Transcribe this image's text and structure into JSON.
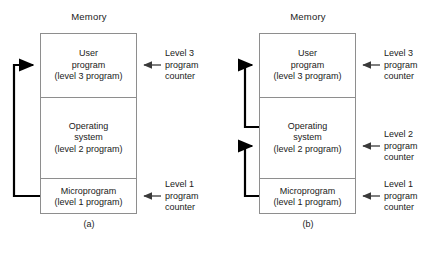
{
  "figure": {
    "background_color": "#ffffff",
    "box_border_color": "#8e8e8e",
    "arrow_color": "#000000",
    "pointer_arrow_color": "#3a3a3a",
    "text_color": "#1a1a1a"
  },
  "panels": [
    {
      "id": "a",
      "caption": "(a)",
      "memory_title": "Memory",
      "segments": [
        {
          "name": "user-program",
          "lines": [
            "User",
            "program",
            "(level 3 program)"
          ]
        },
        {
          "name": "operating-system",
          "lines": [
            "Operating",
            "system",
            "(level 2 program)"
          ]
        },
        {
          "name": "microprogram",
          "lines": [
            "Microprogram",
            "(level 1 program)"
          ]
        }
      ],
      "program_counters": [
        {
          "name": "level-3-program-counter",
          "lines": [
            "Level 3",
            "program",
            "counter"
          ],
          "target_segment": "user-program"
        },
        {
          "name": "level-1-program-counter",
          "lines": [
            "Level 1",
            "program",
            "counter"
          ],
          "target_segment": "microprogram"
        }
      ],
      "control_loops": [
        {
          "name": "microprogram-to-user-program-loop",
          "from_segment": "microprogram",
          "to_segment": "user-program"
        }
      ]
    },
    {
      "id": "b",
      "caption": "(b)",
      "memory_title": "Memory",
      "segments": [
        {
          "name": "user-program",
          "lines": [
            "User",
            "program",
            "(level 3 program)"
          ]
        },
        {
          "name": "operating-system",
          "lines": [
            "Operating",
            "system",
            "(level 2 program)"
          ]
        },
        {
          "name": "microprogram",
          "lines": [
            "Microprogram",
            "(level 1 program)"
          ]
        }
      ],
      "program_counters": [
        {
          "name": "level-3-program-counter",
          "lines": [
            "Level 3",
            "program",
            "counter"
          ],
          "target_segment": "user-program"
        },
        {
          "name": "level-2-program-counter",
          "lines": [
            "Level 2",
            "program",
            "counter"
          ],
          "target_segment": "operating-system"
        },
        {
          "name": "level-1-program-counter",
          "lines": [
            "Level 1",
            "program",
            "counter"
          ],
          "target_segment": "microprogram"
        }
      ],
      "control_loops": [
        {
          "name": "operating-system-to-user-program-loop",
          "from_segment": "operating-system",
          "to_segment": "user-program"
        },
        {
          "name": "microprogram-to-operating-system-loop",
          "from_segment": "microprogram",
          "to_segment": "operating-system"
        }
      ]
    }
  ]
}
